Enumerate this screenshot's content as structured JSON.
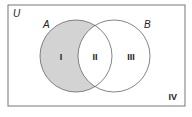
{
  "diagram": {
    "type": "venn",
    "universe_label": "U",
    "sets": [
      {
        "label": "A",
        "cx": 76,
        "cy": 56,
        "r": 36
      },
      {
        "label": "B",
        "cx": 114,
        "cy": 56,
        "r": 36
      }
    ],
    "regions": [
      {
        "label": "I",
        "description": "A only",
        "shaded": true
      },
      {
        "label": "II",
        "description": "A and B",
        "shaded": false
      },
      {
        "label": "III",
        "description": "B only",
        "shaded": false
      },
      {
        "label": "IV",
        "description": "outside A and B",
        "shaded": false
      }
    ],
    "colors": {
      "shade": "#d3d3d3",
      "stroke": "#666666",
      "border": "#777777"
    }
  }
}
